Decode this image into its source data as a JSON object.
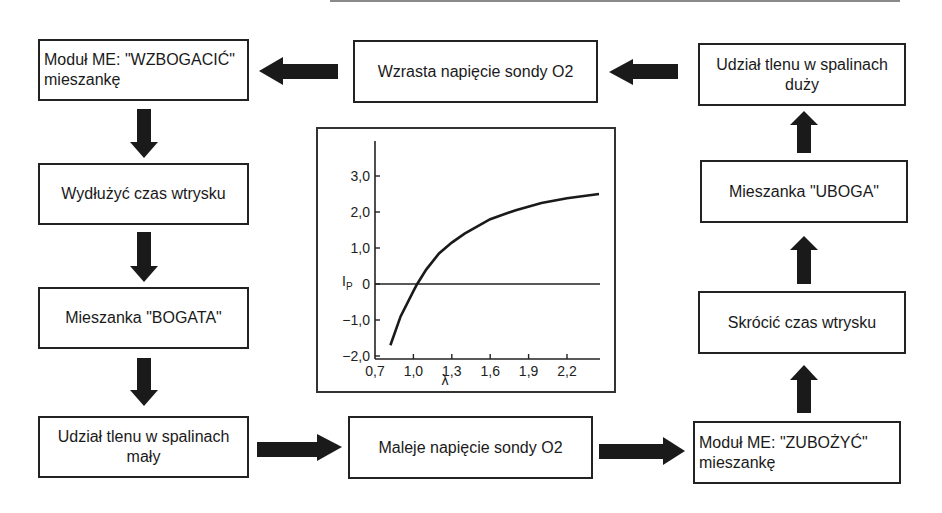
{
  "diagram": {
    "boxes": {
      "wzbogacic": "Moduł ME: \"WZBOGACIĆ\" mieszankę",
      "wzrasta": "Wzrasta napięcie sondy O2",
      "udzial_duzy": "Udział tlenu w spalinach duży",
      "wydluzyc": "Wydłużyć czas wtrysku",
      "uboga": "Mieszanka \"UBOGA\"",
      "bogata": "Mieszanka \"BOGATA\"",
      "skrocic": "Skrócić czas wtrysku",
      "udzial_maly": "Udział tlenu w spalinach mały",
      "maleje": "Maleje napięcie sondy O2",
      "zubozyc": "Moduł ME: \"ZUBOŻYĆ\" mieszankę"
    },
    "colors": {
      "line": "#222222",
      "arrow": "#1a1a1a",
      "background": "#ffffff"
    }
  },
  "chart_data": {
    "type": "line",
    "title": "",
    "xlabel": "λ",
    "ylabel": "IP",
    "ylabel_main": "I",
    "ylabel_sub": "P",
    "x_ticks": [
      "0,7",
      "1,0",
      "1,3",
      "1,6",
      "1,9",
      "2,2"
    ],
    "y_ticks": [
      "3,0",
      "2,0",
      "1,0",
      "0",
      "−1,0",
      "−2,0"
    ],
    "xlim": [
      0.7,
      2.5
    ],
    "ylim": [
      -2.0,
      4.0
    ],
    "grid": false,
    "series": [
      {
        "name": "IP(λ)",
        "x": [
          0.82,
          0.9,
          1.0,
          1.03,
          1.1,
          1.2,
          1.3,
          1.4,
          1.6,
          1.8,
          2.0,
          2.2,
          2.45
        ],
        "y": [
          -1.7,
          -0.9,
          -0.2,
          0.0,
          0.4,
          0.85,
          1.15,
          1.4,
          1.8,
          2.05,
          2.25,
          2.38,
          2.5
        ]
      }
    ],
    "reference_line": {
      "y": 0
    }
  }
}
